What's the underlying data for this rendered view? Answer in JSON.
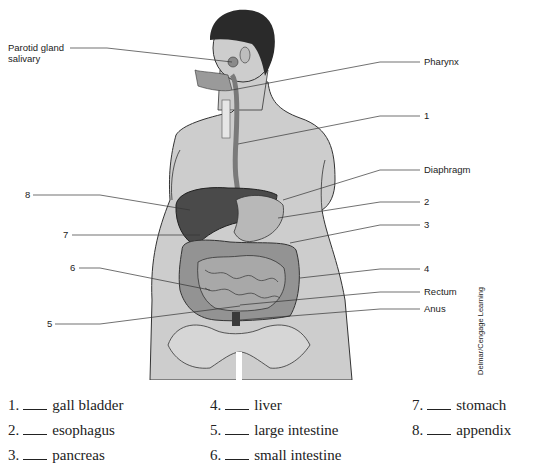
{
  "figure": {
    "callouts_left": [
      {
        "id": "parotid",
        "label": "Parotid gland",
        "label2": "salivary"
      },
      {
        "id": "8",
        "label": "8"
      },
      {
        "id": "7",
        "label": "7"
      },
      {
        "id": "6",
        "label": "6"
      },
      {
        "id": "5",
        "label": "5"
      }
    ],
    "callouts_right": [
      {
        "id": "pharynx",
        "label": "Pharynx"
      },
      {
        "id": "1",
        "label": "1"
      },
      {
        "id": "diaphragm",
        "label": "Diaphragm"
      },
      {
        "id": "2",
        "label": "2"
      },
      {
        "id": "3",
        "label": "3"
      },
      {
        "id": "4",
        "label": "4"
      },
      {
        "id": "rectum",
        "label": "Rectum"
      },
      {
        "id": "anus",
        "label": "Anus"
      }
    ],
    "credit": "Delmar/Cengage Learning",
    "colors": {
      "skin": "#c9c9c9",
      "hair": "#2a2a2a",
      "liver": "#4a4a4a",
      "stomach": "#b5b5b5",
      "intestine": "#8d8d8d",
      "outline": "#333333"
    }
  },
  "answers": [
    {
      "num": "1.",
      "term": "gall bladder"
    },
    {
      "num": "2.",
      "term": "esophagus"
    },
    {
      "num": "3.",
      "term": "pancreas"
    },
    {
      "num": "4.",
      "term": "liver"
    },
    {
      "num": "5.",
      "term": "large intestine"
    },
    {
      "num": "6.",
      "term": "small intestine"
    },
    {
      "num": "7.",
      "term": "stomach"
    },
    {
      "num": "8.",
      "term": "appendix"
    }
  ]
}
